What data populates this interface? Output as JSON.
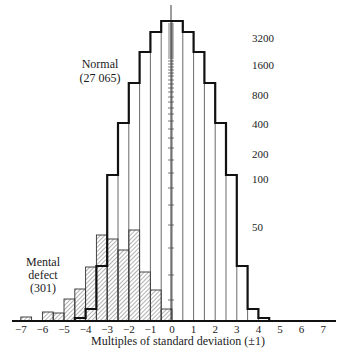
{
  "chart_data": {
    "type": "bar",
    "subtype": "overlaid histogram (log-scaled frequency)",
    "title": "",
    "xlabel": "Multiples of standard deviation (±1)",
    "ylabel": "",
    "x_ticks": [
      -7,
      -6,
      -5,
      -4,
      -3,
      -2,
      -1,
      0,
      1,
      2,
      3,
      4,
      5,
      6,
      7
    ],
    "x_tick_labels": [
      "−7",
      "−6",
      "−5",
      "−4",
      "−3",
      "−2",
      "−1",
      "0",
      "1",
      "2",
      "3",
      "4",
      "5",
      "6",
      "7"
    ],
    "y_scale": "log",
    "y_tick_labels": [
      "3200",
      "1600",
      "800",
      "400",
      "200",
      "100",
      "50"
    ],
    "y_ticks": [
      3200,
      1600,
      800,
      400,
      200,
      100,
      50
    ],
    "bin_width": 0.5,
    "xlim": [
      -7.5,
      7.5
    ],
    "grid": false,
    "series": [
      {
        "name": "Normal",
        "label": "Normal",
        "count_label": "(27 065)",
        "style": "bold outline, open bars",
        "bins": [
          {
            "from": -4.5,
            "to": -4.0,
            "value": 3
          },
          {
            "from": -4.0,
            "to": -3.5,
            "value": 8
          },
          {
            "from": -3.5,
            "to": -3.0,
            "value": 38
          },
          {
            "from": -3.0,
            "to": -2.5,
            "value": 110
          },
          {
            "from": -2.5,
            "to": -2.0,
            "value": 330
          },
          {
            "from": -2.0,
            "to": -1.5,
            "value": 900
          },
          {
            "from": -1.5,
            "to": -1.0,
            "value": 2100
          },
          {
            "from": -1.0,
            "to": -0.5,
            "value": 3600
          },
          {
            "from": -0.5,
            "to": 0.0,
            "value": 4400
          },
          {
            "from": 0.0,
            "to": 0.5,
            "value": 4400
          },
          {
            "from": 0.5,
            "to": 1.0,
            "value": 3600
          },
          {
            "from": 1.0,
            "to": 1.5,
            "value": 2100
          },
          {
            "from": 1.5,
            "to": 2.0,
            "value": 900
          },
          {
            "from": 2.0,
            "to": 2.5,
            "value": 330
          },
          {
            "from": 2.5,
            "to": 3.0,
            "value": 110
          },
          {
            "from": 3.0,
            "to": 3.5,
            "value": 38
          },
          {
            "from": 3.5,
            "to": 4.0,
            "value": 8
          },
          {
            "from": 4.0,
            "to": 4.5,
            "value": 3
          }
        ]
      },
      {
        "name": "Mental defect",
        "label_lines": [
          "Mental",
          "defect"
        ],
        "count_label": "(301)",
        "style": "hatched bars",
        "bins": [
          {
            "from": -7.0,
            "to": -6.5,
            "value": 2
          },
          {
            "from": -6.5,
            "to": -6.0,
            "value": 0
          },
          {
            "from": -6.0,
            "to": -5.5,
            "value": 4
          },
          {
            "from": -5.5,
            "to": -5.0,
            "value": 3
          },
          {
            "from": -5.0,
            "to": -4.5,
            "value": 10
          },
          {
            "from": -4.5,
            "to": -4.0,
            "value": 15
          },
          {
            "from": -4.0,
            "to": -3.5,
            "value": 30
          },
          {
            "from": -3.5,
            "to": -3.0,
            "value": 52
          },
          {
            "from": -3.0,
            "to": -2.5,
            "value": 48
          },
          {
            "from": -2.5,
            "to": -2.0,
            "value": 40
          },
          {
            "from": -2.0,
            "to": -1.5,
            "value": 55
          },
          {
            "from": -1.5,
            "to": -1.0,
            "value": 27
          },
          {
            "from": -1.0,
            "to": -0.5,
            "value": 15
          },
          {
            "from": -0.5,
            "to": 0.0,
            "value": 6
          }
        ]
      }
    ],
    "legend": "inline labels (Normal at upper-left of curve, Mental defect at lower-left)"
  },
  "layout": {
    "x_zero_px": 172,
    "px_per_sd": 21.6,
    "baseline_px": 321,
    "normal_tops_px": [
      318,
      309,
      266,
      175,
      123,
      83,
      52,
      32,
      21,
      21,
      32,
      52,
      83,
      123,
      175,
      266,
      309,
      318
    ],
    "defect_tops_px": [
      317,
      321,
      312,
      313,
      299,
      289,
      267,
      235,
      239,
      250,
      230,
      272,
      290,
      309
    ],
    "y_label_px": [
      42,
      69,
      99,
      128,
      158,
      183,
      231
    ],
    "axis_ticks_px": [
      24,
      26,
      28,
      30,
      32,
      34,
      36,
      38,
      40,
      42,
      44,
      46,
      48,
      50,
      52,
      54,
      56,
      58,
      61,
      64,
      67,
      70,
      73,
      76,
      80,
      84,
      88,
      92,
      97,
      102,
      108,
      114,
      121,
      129,
      138,
      148,
      160,
      173,
      188,
      205,
      225,
      248,
      275,
      300
    ]
  }
}
